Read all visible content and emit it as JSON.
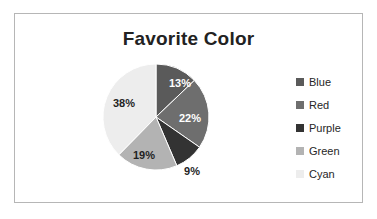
{
  "chart": {
    "title": "Favorite Color",
    "border_color": "#b6b6b6",
    "background": "#ffffff",
    "title_color": "#222222"
  },
  "legend": {
    "position": "right",
    "items": [
      {
        "label": "Blue",
        "color": "#5a5a5a"
      },
      {
        "label": "Red",
        "color": "#6e6e6e"
      },
      {
        "label": "Purple",
        "color": "#333333"
      },
      {
        "label": "Green",
        "color": "#b3b3b3"
      },
      {
        "label": "Cyan",
        "color": "#ededed"
      }
    ]
  },
  "slices": [
    {
      "label": "13%",
      "value": 13,
      "name": "Blue",
      "color": "#5a5a5a",
      "label_x": 24,
      "label_y": -33,
      "dark": true
    },
    {
      "label": "22%",
      "value": 22,
      "name": "Red",
      "color": "#6e6e6e",
      "label_x": 34,
      "label_y": 2,
      "dark": true
    },
    {
      "label": "9%",
      "value": 9,
      "name": "Purple",
      "color": "#333333",
      "label_x": 36,
      "label_y": 55,
      "dark": false
    },
    {
      "label": "19%",
      "value": 19,
      "name": "Green",
      "color": "#b3b3b3",
      "label_x": -12,
      "label_y": 39,
      "dark": false
    },
    {
      "label": "38%",
      "value": 38,
      "name": "Cyan",
      "color": "#ededed",
      "label_x": -32,
      "label_y": -13,
      "dark": false
    }
  ],
  "chart_data": {
    "type": "pie",
    "title": "Favorite Color",
    "categories": [
      "Blue",
      "Red",
      "Purple",
      "Green",
      "Cyan"
    ],
    "values": [
      13,
      22,
      9,
      19,
      38
    ],
    "value_labels": [
      "13%",
      "22%",
      "9%",
      "19%",
      "38%"
    ],
    "unit": "percent",
    "total": 101,
    "start_angle_deg": 0,
    "direction": "clockwise",
    "legend": "right",
    "grid": false,
    "colors": [
      "#5a5a5a",
      "#6e6e6e",
      "#333333",
      "#b3b3b3",
      "#ededed"
    ],
    "xlabel": "",
    "ylabel": ""
  }
}
